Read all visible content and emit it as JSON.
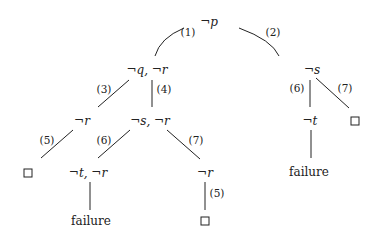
{
  "diagram": {
    "type": "sld-resolution-tree",
    "nodes": {
      "root": "¬p",
      "n1": "¬q, ¬r",
      "n2": "¬s",
      "n3": "¬r",
      "n4": "¬s, ¬r",
      "n5": "¬t, ¬r",
      "n6": "¬r",
      "n7": "¬t",
      "fail1": "failure",
      "fail2": "failure"
    },
    "edges": {
      "e1": "(1)",
      "e2": "(2)",
      "e3": "(3)",
      "e4": "(4)",
      "e5": "(5)",
      "e6": "(6)",
      "e7": "(7)",
      "e8": "(5)",
      "e9": "(6)",
      "e10": "(7)"
    },
    "empty_clause_symbol": "□"
  }
}
